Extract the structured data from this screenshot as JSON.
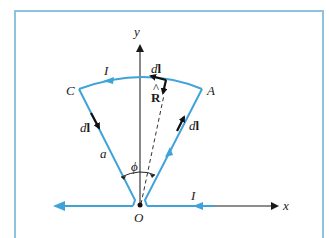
{
  "figure": {
    "axes": {
      "x_label": "x",
      "y_label": "y",
      "origin_label": "O"
    },
    "points": {
      "A": "A",
      "C": "C"
    },
    "current_labels": {
      "arc": "I",
      "x_axis": "I"
    },
    "element_labels": {
      "arc_top_d": "d",
      "arc_top_l": "l",
      "left_d": "d",
      "left_l": "l",
      "right_d": "d",
      "right_l": "l"
    },
    "unit_vector": {
      "hat": "^",
      "symbol": "R"
    },
    "radius_label": "a",
    "angle_label": "ϕ",
    "colors": {
      "wire": "#3fa3d9",
      "axis": "#1a1a1a",
      "vector": "#111111",
      "frame": "#8fc3dd"
    }
  }
}
